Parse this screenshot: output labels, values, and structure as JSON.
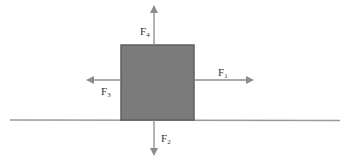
{
  "diagram": {
    "colors": {
      "block_fill": "#7b7b7b",
      "block_border": "#5f5f5f",
      "arrow": "#8c8c8c",
      "ground": "#9a9a9a",
      "text": "#333333"
    },
    "block": {
      "label": "block"
    },
    "ground": {
      "label": "surface"
    },
    "forces": [
      {
        "id": "F1",
        "base": "F",
        "sub": "1",
        "direction": "right"
      },
      {
        "id": "F2",
        "base": "F",
        "sub": "2",
        "direction": "down"
      },
      {
        "id": "F3",
        "base": "F",
        "sub": "3",
        "direction": "left"
      },
      {
        "id": "F4",
        "base": "F",
        "sub": "4",
        "direction": "up"
      }
    ]
  }
}
